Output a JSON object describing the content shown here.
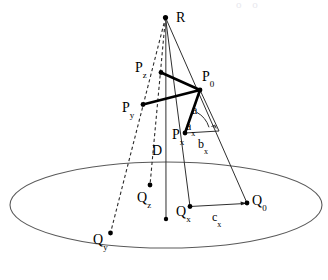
{
  "figure": {
    "title": "",
    "background_color": "#ffffff",
    "stroke_color": "#1a1a1a",
    "thin_stroke_color": "#3a3a3a",
    "ellipse_stroke_color": "#555555",
    "dash_color": "#333333",
    "width": 328,
    "height": 280
  },
  "ground_plane": {
    "name": "ground-ellipse",
    "cx": 166,
    "cy": 205,
    "rx": 156,
    "ry": 43
  },
  "points": {
    "R": {
      "label_base": "R",
      "label_sub": "",
      "x": 165.5,
      "y": 17.5,
      "label_x": 176,
      "label_y": 9,
      "dot": true
    },
    "P0": {
      "label_base": "P",
      "label_sub": "0",
      "x": 200.0,
      "y": 90.0,
      "label_x": 202,
      "label_y": 68,
      "dot": true
    },
    "Pz": {
      "label_base": "P",
      "label_sub": "z",
      "x": 161.0,
      "y": 72.5,
      "label_x": 135,
      "label_y": 59,
      "dot": true
    },
    "Py": {
      "label_base": "P",
      "label_sub": "y",
      "x": 143.0,
      "y": 104.5,
      "label_x": 122,
      "label_y": 99,
      "dot": true
    },
    "Px": {
      "label_base": "P",
      "label_sub": "x",
      "x": 185.0,
      "y": 133.0,
      "label_x": 172,
      "label_y": 128,
      "dot": true
    },
    "Q0": {
      "label_base": "Q",
      "label_sub": "0",
      "x": 247.0,
      "y": 203.0,
      "label_x": 252,
      "label_y": 192,
      "dot": true
    },
    "Qx": {
      "label_base": "Q",
      "label_sub": "x",
      "x": 190.0,
      "y": 206.5,
      "label_x": 176,
      "label_y": 203,
      "dot": true
    },
    "Qz": {
      "label_base": "Q",
      "label_sub": "z",
      "x": 150.0,
      "y": 185.0,
      "label_x": 137,
      "label_y": 190,
      "dot": true
    },
    "Qy": {
      "label_base": "Q",
      "label_sub": "y",
      "x": 110.5,
      "y": 233.0,
      "label_x": 93,
      "label_y": 231,
      "dot": true
    },
    "Dfoot": {
      "label_base": "",
      "label_sub": "",
      "x": 166.0,
      "y": 219.0,
      "label_x": 0,
      "label_y": 0,
      "dot": true
    }
  },
  "segment_labels": [
    {
      "name": "label-a",
      "base": "a",
      "sub": "",
      "x": 192,
      "y": 101
    },
    {
      "name": "label-a-x",
      "base": "a",
      "sub": "x",
      "x": 186,
      "y": 119
    },
    {
      "name": "label-b-x",
      "base": "b",
      "sub": "x",
      "x": 198,
      "y": 137
    },
    {
      "name": "label-c-x",
      "base": "c",
      "sub": "x",
      "x": 212,
      "y": 209
    },
    {
      "name": "label-D",
      "base": "D",
      "sub": "",
      "x": 152,
      "y": 143
    }
  ],
  "edges": {
    "bold_polyline": [
      "Pz",
      "P0",
      "Py"
    ],
    "bold_segment": [
      "P0",
      "Px"
    ],
    "rays_from_R": [
      "Px",
      "Qx",
      "Q0",
      "Dfoot"
    ],
    "dashed_rays_from_R": [
      "Pz",
      "Qz",
      "Py",
      "Qy"
    ],
    "ground_link": [
      "Qx",
      "Q0"
    ],
    "vertical_drop": [
      "R",
      "Dfoot"
    ],
    "right_angle_marker": {
      "x": 212,
      "y": 122,
      "size": 5
    },
    "angle_arc_at_Px": {
      "cx": 185,
      "cy": 133,
      "radius": 26
    }
  },
  "ghost_text": {
    "content": "o o",
    "x": 236,
    "y": 0
  }
}
